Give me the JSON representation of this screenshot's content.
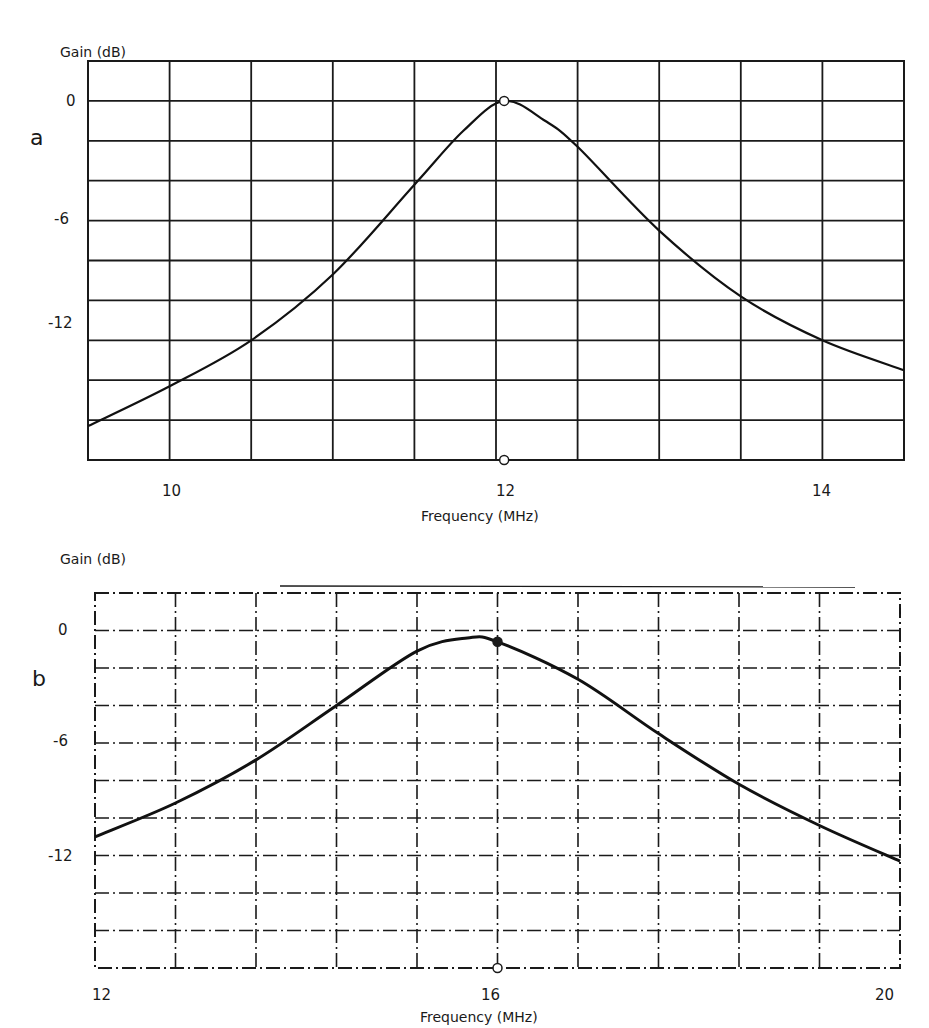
{
  "chart_data": [
    {
      "id": "a",
      "type": "line",
      "panel_label": "a",
      "title": "",
      "xlabel": "Frequency (MHz)",
      "ylabel": "Gain (dB)",
      "xlim": [
        9.5,
        14.5
      ],
      "ylim": [
        -18,
        2
      ],
      "x_ticks": [
        10,
        12,
        14
      ],
      "y_ticks": [
        0,
        -6,
        -12
      ],
      "x_grid_step": 0.5,
      "y_grid_step": 2,
      "grid": true,
      "grid_style": "solid",
      "legend": null,
      "series": [
        {
          "name": "Gain response",
          "x": [
            9.5,
            10.0,
            10.5,
            11.0,
            11.5,
            11.8,
            12.05,
            12.3,
            12.5,
            13.0,
            13.5,
            14.0,
            14.5
          ],
          "y": [
            -16.3,
            -14.3,
            -12.0,
            -8.7,
            -4.2,
            -1.5,
            0.0,
            -1.0,
            -2.3,
            -6.5,
            -9.8,
            -12.0,
            -13.5
          ]
        }
      ],
      "annotations": [
        {
          "type": "marker",
          "shape": "open-circle",
          "x": 12.05,
          "y": 0.0
        },
        {
          "type": "marker",
          "shape": "open-circle",
          "x": 12.05,
          "y": -18.0
        }
      ]
    },
    {
      "id": "b",
      "type": "line",
      "panel_label": "b",
      "title": "",
      "xlabel": "Frequency (MHz)",
      "ylabel": "Gain (dB)",
      "xlim": [
        12,
        20
      ],
      "ylim": [
        -18,
        2
      ],
      "x_ticks": [
        12,
        16,
        20
      ],
      "y_ticks": [
        0,
        -6,
        -12
      ],
      "x_grid_step": 0.8,
      "y_grid_step": 2,
      "grid": true,
      "grid_style": "dash-dot",
      "legend": null,
      "series": [
        {
          "name": "Gain response",
          "x": [
            12.0,
            12.8,
            13.6,
            14.4,
            15.2,
            15.7,
            16.0,
            16.8,
            17.6,
            18.4,
            19.2,
            20.0
          ],
          "y": [
            -11.0,
            -9.2,
            -6.9,
            -4.0,
            -1.1,
            -0.4,
            -0.6,
            -2.6,
            -5.5,
            -8.2,
            -10.4,
            -12.3
          ]
        }
      ],
      "annotations": [
        {
          "type": "marker",
          "shape": "filled-circle",
          "x": 16.0,
          "y": -0.6
        },
        {
          "type": "marker",
          "shape": "open-circle",
          "x": 16.0,
          "y": -18.0
        }
      ]
    }
  ],
  "panels": {
    "a": {
      "letter": "a",
      "ylabel": "Gain (dB)",
      "xlabel": "Frequency (MHz)",
      "y_tick_labels": [
        "0",
        "-6",
        "-12"
      ],
      "x_tick_labels": [
        "10",
        "12",
        "14"
      ]
    },
    "b": {
      "letter": "b",
      "ylabel": "Gain (dB)",
      "xlabel": "Frequency (MHz)",
      "y_tick_labels": [
        "0",
        "-6",
        "-12"
      ],
      "x_tick_labels": [
        "12",
        "16",
        "20"
      ]
    }
  }
}
